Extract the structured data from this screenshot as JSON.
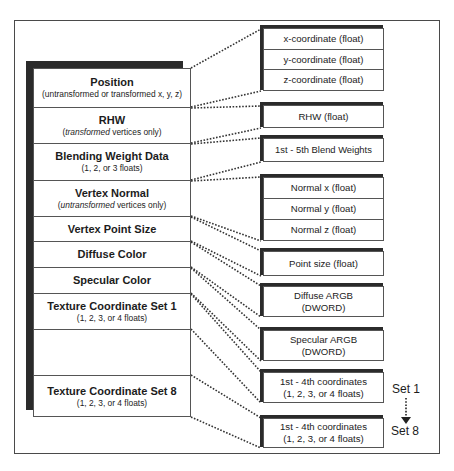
{
  "diagram": {
    "type": "vertex-format-layout",
    "left_stack": {
      "rows": [
        {
          "title": "Position",
          "sub": "(untransformed or transformed x, y, z)"
        },
        {
          "title": "RHW",
          "sub_italic": "transformed",
          "sub_rest": " vertices only)",
          "sub_open": "("
        },
        {
          "title": "Blending Weight Data",
          "sub": "(1, 2, or 3 floats)"
        },
        {
          "title": "Vertex Normal",
          "sub_italic": "untransformed",
          "sub_rest": " vertices only)",
          "sub_open": "("
        },
        {
          "title": "Vertex Point Size"
        },
        {
          "title": "Diffuse Color"
        },
        {
          "title": "Specular Color"
        },
        {
          "title": "Texture Coordinate Set 1",
          "sub": "(1, 2, 3, or 4 floats)"
        },
        {
          "title": "",
          "arrow": "down-dotted-arrow"
        },
        {
          "title": "Texture Coordinate Set 8",
          "sub": "(1, 2, 3, or 4 floats)"
        }
      ]
    },
    "right_boxes": [
      {
        "cells": [
          "x-coordinate (float)",
          "y-coordinate (float)",
          "z-coordinate (float)"
        ]
      },
      {
        "cells": [
          "RHW (float)"
        ]
      },
      {
        "cells": [
          "1st - 5th Blend Weights"
        ]
      },
      {
        "cells": [
          "Normal x (float)",
          "Normal y (float)",
          "Normal z (float)"
        ]
      },
      {
        "cells": [
          "Point size (float)"
        ]
      },
      {
        "cells": [
          "Diffuse ARGB",
          "(DWORD)"
        ]
      },
      {
        "cells": [
          "Specular ARGB",
          "(DWORD)"
        ]
      },
      {
        "cells": [
          "1st - 4th coordinates",
          "(1, 2, 3, or 4 floats)"
        ]
      },
      {
        "cells": [
          "1st - 4th coordinates",
          "(1, 2, 3, or 4 floats)"
        ]
      }
    ],
    "set_labels": {
      "start": "Set 1",
      "end": "Set 8"
    },
    "colors": {
      "line": "#555555",
      "shadow": "#2b2b2b",
      "background": "#ffffff"
    }
  }
}
